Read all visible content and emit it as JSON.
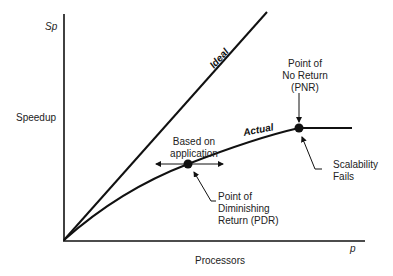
{
  "diagram": {
    "y_axis_symbol": "Sp",
    "y_axis_label": "Speedup",
    "x_axis_symbol": "p",
    "x_axis_label": "Processors",
    "ideal_label": "Ideal",
    "actual_label": "Actual",
    "pnr_label": [
      "Point of",
      "No Return",
      "(PNR)"
    ],
    "pdr_label": [
      "Point of",
      "Diminishing",
      "Return (PDR)"
    ],
    "based_on_label": [
      "Based on",
      "application"
    ],
    "scalability_label": [
      "Scalability",
      "Fails"
    ],
    "colors": {
      "line": "#111111",
      "background": "#ffffff"
    }
  }
}
